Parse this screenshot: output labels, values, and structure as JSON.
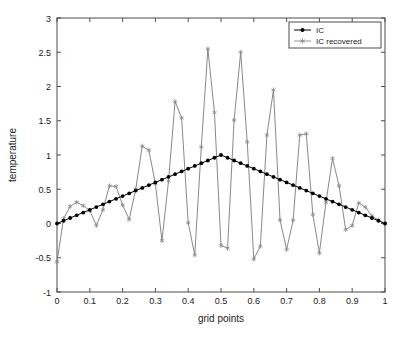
{
  "chart_data": {
    "type": "line",
    "title": "",
    "xlabel": "grid points",
    "ylabel": "temperature",
    "xlim": [
      0,
      1
    ],
    "ylim": [
      -1,
      3
    ],
    "xticks": [
      0,
      0.1,
      0.2,
      0.3,
      0.4,
      0.5,
      0.6,
      0.7,
      0.8,
      0.9,
      1
    ],
    "xticklabels": [
      "0",
      "0.1",
      "0.2",
      "0.3",
      "0.4",
      "0.5",
      "0.6",
      "0.7",
      "0.8",
      "0.9",
      "1"
    ],
    "yticks": [
      -1,
      -0.5,
      0,
      0.5,
      1,
      1.5,
      2,
      2.5,
      3
    ],
    "yticklabels": [
      "-1",
      "-0.5",
      "0",
      "0.5",
      "1",
      "1.5",
      "2",
      "2.5",
      "3"
    ],
    "grid": false,
    "legend_position": "upper right",
    "legend_entries": [
      "IC",
      "IC recovered"
    ],
    "series": [
      {
        "name": "IC",
        "color": "#000000",
        "marker": "filled-circle",
        "x": [
          0,
          0.02,
          0.04,
          0.06,
          0.08,
          0.1,
          0.12,
          0.14,
          0.16,
          0.18,
          0.2,
          0.22,
          0.24,
          0.26,
          0.28,
          0.3,
          0.32,
          0.34,
          0.36,
          0.38,
          0.4,
          0.42,
          0.44,
          0.46,
          0.48,
          0.5,
          0.52,
          0.54,
          0.56,
          0.58,
          0.6,
          0.62,
          0.64,
          0.66,
          0.68,
          0.7,
          0.72,
          0.74,
          0.76,
          0.78,
          0.8,
          0.82,
          0.84,
          0.86,
          0.88,
          0.9,
          0.92,
          0.94,
          0.96,
          0.98,
          1
        ],
        "values": [
          0,
          0.04,
          0.08,
          0.12,
          0.16,
          0.2,
          0.24,
          0.28,
          0.32,
          0.36,
          0.4,
          0.44,
          0.48,
          0.52,
          0.56,
          0.6,
          0.64,
          0.68,
          0.72,
          0.76,
          0.8,
          0.84,
          0.88,
          0.92,
          0.96,
          1,
          0.96,
          0.92,
          0.88,
          0.84,
          0.8,
          0.76,
          0.72,
          0.68,
          0.64,
          0.6,
          0.56,
          0.52,
          0.48,
          0.44,
          0.4,
          0.36,
          0.32,
          0.28,
          0.24,
          0.2,
          0.16,
          0.12,
          0.08,
          0.04,
          0
        ]
      },
      {
        "name": "IC recovered",
        "color": "#7a7a7a",
        "marker": "star",
        "x": [
          0,
          0.02,
          0.04,
          0.06,
          0.08,
          0.1,
          0.12,
          0.14,
          0.16,
          0.18,
          0.2,
          0.22,
          0.24,
          0.26,
          0.28,
          0.3,
          0.32,
          0.34,
          0.36,
          0.38,
          0.4,
          0.42,
          0.44,
          0.46,
          0.48,
          0.5,
          0.52,
          0.54,
          0.56,
          0.58,
          0.6,
          0.62,
          0.64,
          0.66,
          0.68,
          0.7,
          0.72,
          0.74,
          0.76,
          0.78,
          0.8,
          0.82,
          0.84,
          0.86,
          0.88,
          0.9,
          0.92,
          0.94,
          0.96,
          0.98,
          1
        ],
        "values": [
          -0.56,
          0.07,
          0.25,
          0.31,
          0.26,
          0.19,
          -0.03,
          0.2,
          0.55,
          0.54,
          0.27,
          0.06,
          0.5,
          1.13,
          1.07,
          0.58,
          -0.25,
          0.62,
          1.78,
          1.54,
          0.01,
          -0.46,
          1.12,
          2.55,
          1.62,
          -0.32,
          -0.36,
          1.51,
          2.5,
          1.19,
          -0.52,
          -0.33,
          1.29,
          1.95,
          0.05,
          -0.38,
          0.05,
          1.29,
          1.31,
          0.13,
          -0.43,
          0.31,
          0.95,
          0.55,
          -0.09,
          -0.03,
          0.3,
          0.24,
          0.11,
          0.05,
          0.0
        ]
      }
    ]
  }
}
